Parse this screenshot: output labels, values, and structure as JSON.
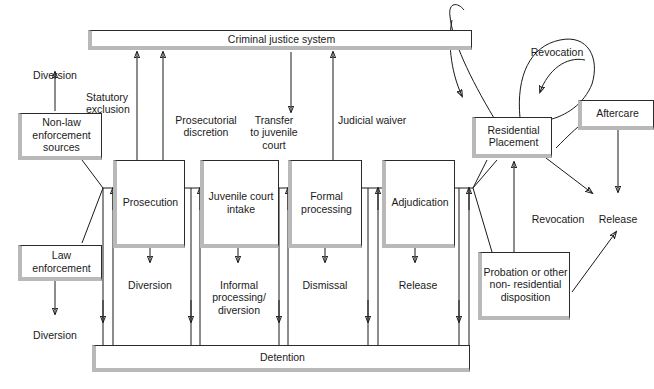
{
  "diagram": {
    "type": "flowchart",
    "bars": {
      "criminal_justice_system": "Criminal justice system",
      "detention": "Detention"
    },
    "sources": {
      "non_law_enforcement": "Non-law\nenforcement\nsources",
      "law_enforcement": "Law\nenforcement",
      "diversion_top": "Diversion",
      "diversion_bottom": "Diversion"
    },
    "stages": {
      "prosecution": "Prosecution",
      "juvenile_court_intake": "Juvenile\ncourt intake",
      "formal_processing": "Formal\nprocessing",
      "adjudication": "Adjudication"
    },
    "stage_outputs": {
      "prosecution_out": "Diversion",
      "intake_out": "Informal\nprocessing/\ndiversion",
      "formal_out": "Dismissal",
      "adjudication_out": "Release"
    },
    "transfer_labels": {
      "statutory_exclusion": "Statutory\nexclusion",
      "prosecutorial_discretion": "Prosecutorial\ndiscretion",
      "transfer_to_juvenile_court": "Transfer\nto juvenile\ncourt",
      "judicial_waiver": "Judicial waiver"
    },
    "dispositions": {
      "residential_placement": "Residential\nPlacement",
      "aftercare": "Aftercare",
      "probation": "Probation or\nother non-\nresidential\ndisposition"
    },
    "outcomes": {
      "revocation_top": "Revocation",
      "revocation_mid": "Revocation",
      "release": "Release"
    },
    "colors": {
      "line": "#1a1a1a",
      "box_shadow": "#b9b9b9",
      "box_fill": "#ffffff",
      "text": "#1a1a1a",
      "page_background": "#ffffff"
    }
  }
}
